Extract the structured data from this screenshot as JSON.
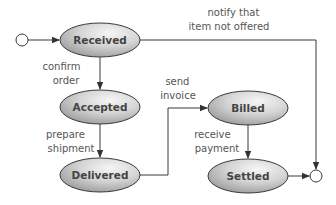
{
  "diagram": {
    "type": "state-machine",
    "colors": {
      "state_fill_light": "#f4f4f4",
      "state_fill_dark": "#9a9a9a",
      "stroke": "#3a3a3a",
      "label_text": "#555555"
    },
    "states": [
      {
        "id": "received",
        "label": "Received"
      },
      {
        "id": "accepted",
        "label": "Accepted"
      },
      {
        "id": "delivered",
        "label": "Delivered"
      },
      {
        "id": "billed",
        "label": "Billed"
      },
      {
        "id": "settled",
        "label": "Settled"
      }
    ],
    "pseudostates": [
      {
        "id": "initial",
        "kind": "initial"
      },
      {
        "id": "final",
        "kind": "final"
      }
    ],
    "transitions": [
      {
        "from": "initial",
        "to": "received",
        "label_lines": []
      },
      {
        "from": "received",
        "to": "accepted",
        "label_lines": [
          "confirm",
          "order"
        ]
      },
      {
        "from": "accepted",
        "to": "delivered",
        "label_lines": [
          "prepare",
          "shipment"
        ]
      },
      {
        "from": "delivered",
        "to": "billed",
        "label_lines": [
          "send",
          "invoice"
        ]
      },
      {
        "from": "billed",
        "to": "settled",
        "label_lines": [
          "receive",
          "payment"
        ]
      },
      {
        "from": "settled",
        "to": "final",
        "label_lines": []
      },
      {
        "from": "received",
        "to": "final",
        "label_lines": [
          "notify that",
          "item not offered"
        ]
      }
    ]
  }
}
